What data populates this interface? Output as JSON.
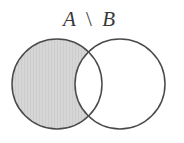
{
  "figure": {
    "width": 184,
    "height": 143,
    "background_color": "#ffffff",
    "type": "venn-diagram"
  },
  "caption": {
    "full_text": "A \\ B",
    "left_set": "A",
    "operator": "\\",
    "right_set": "B",
    "text_color": "#3a3a3a",
    "font_size": 21,
    "center_x": 89,
    "baseline_y": 26
  },
  "sets": [
    {
      "id": "set-a",
      "label": "A",
      "cx": 57,
      "cy": 84,
      "r": 45,
      "fill": "#d4d4d4",
      "filled": true,
      "stroke": "#4a4a4a",
      "stroke_width": 1.5
    },
    {
      "id": "set-b",
      "label": "B",
      "cx": 120,
      "cy": 84,
      "r": 45,
      "fill": "#ffffff",
      "filled": false,
      "stroke": "#4a4a4a",
      "stroke_width": 1.5
    }
  ],
  "shaded_region": {
    "name": "A-minus-B",
    "fill": "#d4d4d4",
    "hatch_color": "#c8c8c8",
    "description": "Region inside circle A and outside circle B"
  },
  "intersection": {
    "name": "A-intersect-B",
    "fill": "#ffffff",
    "filled": false,
    "upper_point_x": 93,
    "upper_point_y": 55,
    "lower_point_x": 93,
    "lower_point_y": 118
  },
  "chart_data": {
    "type": "diagram",
    "title": "A \\ B",
    "subtype": "venn-2set",
    "categories": [
      "A only",
      "A ∩ B",
      "B only"
    ],
    "shaded": [
      true,
      false,
      false
    ],
    "values": [
      1,
      0,
      0
    ],
    "xlabel": "",
    "ylabel": "",
    "legend": []
  }
}
